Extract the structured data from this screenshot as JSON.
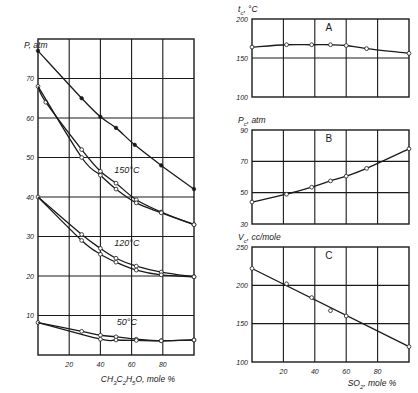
{
  "chart_data": [
    {
      "id": "main",
      "type": "line",
      "title": "",
      "xlabel": "CH3C2H5O, mole %",
      "ylabel": "P, atm",
      "xlim": [
        0,
        100
      ],
      "ylim": [
        0,
        80
      ],
      "xticks": [
        20,
        40,
        60,
        80
      ],
      "yticks": [
        10,
        20,
        30,
        40,
        50,
        60,
        70
      ],
      "grid": true,
      "annotations": [
        {
          "text": "150°C",
          "x": 57,
          "y": 46
        },
        {
          "text": "120°C",
          "x": 57,
          "y": 27.5
        },
        {
          "text": "50°C",
          "x": 57,
          "y": 7.5
        }
      ],
      "series": [
        {
          "name": "Critical line",
          "marker": "filled",
          "x": [
            0,
            28,
            40,
            50,
            62,
            79,
            100
          ],
          "y": [
            77,
            65,
            60.3,
            57.5,
            53.2,
            48,
            42
          ]
        },
        {
          "name": "150°C upper",
          "marker": "open",
          "x": [
            0,
            5,
            28,
            40,
            50,
            63,
            79,
            100
          ],
          "y": [
            68,
            64,
            52,
            46.5,
            43.5,
            39.3,
            36.2,
            33
          ]
        },
        {
          "name": "150°C lower",
          "marker": "open",
          "x": [
            0,
            28,
            40,
            50,
            63,
            79,
            100
          ],
          "y": [
            68,
            50,
            45.5,
            42,
            38.5,
            36,
            33
          ]
        },
        {
          "name": "120°C upper",
          "marker": "open",
          "x": [
            0,
            28,
            40,
            50,
            63,
            79,
            100
          ],
          "y": [
            40,
            30.5,
            27,
            24.5,
            22.5,
            21,
            19.8
          ]
        },
        {
          "name": "120°C lower",
          "marker": "open",
          "x": [
            0,
            28,
            40,
            50,
            63,
            79,
            100
          ],
          "y": [
            40,
            29,
            25.5,
            23.5,
            21.5,
            20.3,
            19.8
          ]
        },
        {
          "name": "50°C upper",
          "marker": "open",
          "x": [
            0,
            28,
            40,
            50,
            63,
            79,
            100
          ],
          "y": [
            8.2,
            6,
            5,
            4.6,
            4,
            3.6,
            3.8
          ]
        },
        {
          "name": "50°C lower",
          "marker": "open",
          "x": [
            0,
            40,
            50,
            63,
            79,
            100
          ],
          "y": [
            8.2,
            4,
            3.8,
            3.7,
            3.6,
            3.8
          ]
        }
      ]
    },
    {
      "id": "A",
      "type": "line",
      "panel_label": "A",
      "ylabel": "tc, °C",
      "xlabel": "",
      "xlim": [
        0,
        100
      ],
      "ylim": [
        100,
        200
      ],
      "xticks": [
        20,
        40,
        60,
        80
      ],
      "yticks": [
        100,
        150,
        200
      ],
      "grid": true,
      "series": [
        {
          "name": "Critical temperature",
          "marker": "open",
          "x": [
            0,
            22,
            38,
            50,
            60,
            73,
            100
          ],
          "y": [
            164,
            167,
            167,
            167,
            166,
            162,
            156
          ]
        }
      ]
    },
    {
      "id": "B",
      "type": "line",
      "panel_label": "B",
      "ylabel": "Pc, atm",
      "xlabel": "",
      "xlim": [
        0,
        100
      ],
      "ylim": [
        30,
        90
      ],
      "xticks": [
        20,
        40,
        60,
        80
      ],
      "yticks": [
        30,
        50,
        70,
        90
      ],
      "grid": true,
      "series": [
        {
          "name": "Critical pressure",
          "marker": "open",
          "x": [
            0,
            22,
            38,
            50,
            60,
            73,
            100
          ],
          "y": [
            44,
            49,
            53.5,
            57.5,
            60.5,
            65.5,
            78
          ]
        }
      ]
    },
    {
      "id": "C",
      "type": "line",
      "panel_label": "C",
      "ylabel": "Vc, cc/mole",
      "xlabel": "SO2, mole %",
      "xlim": [
        0,
        100
      ],
      "ylim": [
        100,
        250
      ],
      "xticks": [
        20,
        40,
        60,
        80
      ],
      "yticks": [
        100,
        150,
        200,
        250
      ],
      "grid": true,
      "series": [
        {
          "name": "Critical volume",
          "marker": "open",
          "line": "linear",
          "x": [
            0,
            22,
            38,
            50,
            60,
            100
          ],
          "y": [
            222,
            202,
            184,
            167,
            160,
            120
          ]
        }
      ]
    }
  ],
  "labels": {
    "main_ylabel": "P, atm",
    "main_xlabel": "CH3C2H5O, mole %",
    "a_ylabel": "tc, °C",
    "b_ylabel": "Pc, atm",
    "c_ylabel": "Vc, cc/mole",
    "c_xlabel": "SO2, mole %"
  }
}
